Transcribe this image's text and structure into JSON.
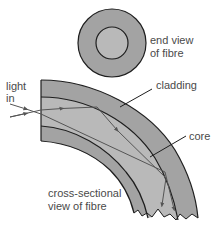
{
  "diagram": {
    "labels": {
      "end_view_line1": "end view",
      "end_view_line2": "of fibre",
      "light_line1": "light",
      "light_line2": "in",
      "cladding": "cladding",
      "core": "core",
      "cross_section_line1": "cross-sectional",
      "cross_section_line2": "view of fibre"
    },
    "colors": {
      "cladding": "#a3a3a3",
      "core": "#b9b9b9",
      "outline": "#1e1e1e",
      "text": "#4a4a4a",
      "ray": "#555555"
    },
    "end_view": {
      "center": [
        112,
        43
      ],
      "outer_radius": 34,
      "inner_radius": 16
    }
  }
}
